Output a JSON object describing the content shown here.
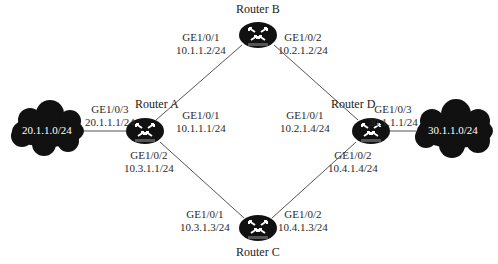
{
  "diagram": {
    "type": "network-topology",
    "routers": [
      {
        "id": "A",
        "name": "Router A",
        "badge": "ROUTER",
        "interfaces": [
          {
            "port": "GE1/0/3",
            "ip": "20.1.1.1/24"
          },
          {
            "port": "GE1/0/1",
            "ip": "10.1.1.1/24"
          },
          {
            "port": "GE1/0/2",
            "ip": "10.3.1.1/24"
          }
        ]
      },
      {
        "id": "B",
        "name": "Router B",
        "badge": "ROUTER",
        "interfaces": [
          {
            "port": "GE1/0/1",
            "ip": "10.1.1.2/24"
          },
          {
            "port": "GE1/0/2",
            "ip": "10.2.1.2/24"
          }
        ]
      },
      {
        "id": "C",
        "name": "Router C",
        "badge": "ROUTER",
        "interfaces": [
          {
            "port": "GE1/0/1",
            "ip": "10.3.1.3/24"
          },
          {
            "port": "GE1/0/2",
            "ip": "10.4.1.3/24"
          }
        ]
      },
      {
        "id": "D",
        "name": "Router D",
        "badge": "ROUTER",
        "interfaces": [
          {
            "port": "GE1/0/1",
            "ip": "10.2.1.4/24"
          },
          {
            "port": "GE1/0/3",
            "ip": "30.1.1.1/24"
          },
          {
            "port": "GE1/0/2",
            "ip": "10.4.1.4/24"
          }
        ]
      }
    ],
    "networks": [
      {
        "id": "left",
        "label": "20.1.1.0/24"
      },
      {
        "id": "right",
        "label": "30.1.1.0/24"
      }
    ],
    "links": [
      {
        "from": "left-cloud",
        "to": "A"
      },
      {
        "from": "A",
        "to": "B"
      },
      {
        "from": "A",
        "to": "C"
      },
      {
        "from": "B",
        "to": "D"
      },
      {
        "from": "C",
        "to": "D"
      },
      {
        "from": "D",
        "to": "right-cloud"
      }
    ]
  }
}
